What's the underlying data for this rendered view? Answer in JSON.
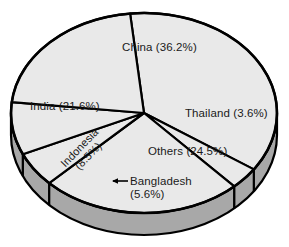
{
  "chart_data": {
    "type": "pie",
    "title": "",
    "subtitle": "",
    "xlabel": "",
    "ylabel": "",
    "legend_position": "none",
    "grid": false,
    "three_d": true,
    "categories": [
      "China",
      "India",
      "Others",
      "Indonesia",
      "Bangladesh",
      "Thailand"
    ],
    "values": [
      36.2,
      21.6,
      24.5,
      8.5,
      5.6,
      3.6
    ],
    "units": "%",
    "slices": [
      {
        "label": "China",
        "value": 36.2,
        "display": "China (36.2%)"
      },
      {
        "label": "Thailand",
        "value": 3.6,
        "display": "Thailand (3.6%)"
      },
      {
        "label": "Others",
        "value": 24.5,
        "display": "Others (24.5%)"
      },
      {
        "label": "Bangladesh",
        "value": 5.6,
        "display": "Bangladesh (5.6%)"
      },
      {
        "label": "Indonesia",
        "value": 8.5,
        "display": "Indonesia (8.5%)"
      },
      {
        "label": "India",
        "value": 21.6,
        "display": "India (21.6%)"
      }
    ],
    "annotations": [
      {
        "name": "bangladesh-leader-arrow",
        "points_to": "Bangladesh",
        "direction": "left"
      }
    ]
  },
  "labels": {
    "china": "China (36.2%)",
    "india": "India (21.6%)",
    "thailand": "Thailand (3.6%)",
    "others": "Others (24.5%)",
    "bangladesh_line1": "Bangladesh",
    "bangladesh_line2": "(5.6%)",
    "indonesia_line1": "Indonesia",
    "indonesia_line2": "(8.5%)"
  },
  "colors": {
    "top_face": "#e9e9e9",
    "side_wall": "#a8a8a8",
    "outline": "#000000",
    "background": "#ffffff",
    "text": "#1a1a1a"
  }
}
